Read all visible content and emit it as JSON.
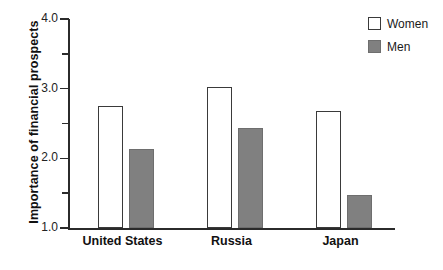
{
  "chart_data": {
    "type": "bar",
    "title": "",
    "xlabel": "",
    "ylabel": "Importance of financial prospects",
    "categories": [
      "United States",
      "Russia",
      "Japan"
    ],
    "series": [
      {
        "name": "Women",
        "values": [
          2.75,
          3.03,
          2.68
        ],
        "color": "#ffffff"
      },
      {
        "name": "Men",
        "values": [
          2.13,
          2.43,
          1.48
        ],
        "color": "#808080"
      }
    ],
    "ylim": [
      1.0,
      4.0
    ],
    "y_major_ticks": [
      "1.0",
      "2.0",
      "3.0",
      "4.0"
    ],
    "y_minor_ticks": [
      "1.5",
      "2.5",
      "3.5"
    ],
    "grid": false,
    "legend_position": "top-right"
  },
  "axis": {
    "y_title": "Importance of financial prospects",
    "y_tick_labels": [
      "4.0",
      "3.0",
      "2.0",
      "1.0"
    ]
  },
  "legend": {
    "entries": [
      {
        "label": "Women",
        "swatch": "open-square-icon"
      },
      {
        "label": "Men",
        "swatch": "filled-square-icon"
      }
    ]
  },
  "categories": [
    {
      "label": "United States"
    },
    {
      "label": "Russia"
    },
    {
      "label": "Japan"
    }
  ],
  "colors": {
    "women_fill": "#ffffff",
    "men_fill": "#808080",
    "axis": "#2b2b2b",
    "text": "#111111"
  }
}
